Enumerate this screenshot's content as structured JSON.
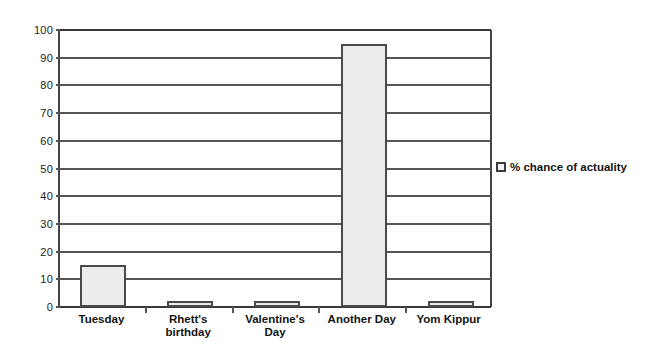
{
  "chart_data": {
    "type": "bar",
    "title": "",
    "subtitle": "",
    "xlabel": "",
    "ylabel": "",
    "categories": [
      "Tuesday",
      "Rhett's birthday",
      "Valentine's Day",
      "Another Day",
      "Yom Kippur"
    ],
    "category_lines": [
      [
        "Tuesday"
      ],
      [
        "Rhett's",
        "birthday"
      ],
      [
        "Valentine's",
        "Day"
      ],
      [
        "Another Day"
      ],
      [
        "Yom Kippur"
      ]
    ],
    "series": [
      {
        "name": "% chance of actuality",
        "values": [
          15,
          2,
          2,
          95,
          2
        ]
      }
    ],
    "ylim": [
      0,
      100
    ],
    "ytick_step": 10,
    "yticks": [
      100,
      90,
      80,
      70,
      60,
      50,
      40,
      30,
      20,
      10,
      0
    ],
    "grid": true,
    "grid_axis": "y",
    "legend": {
      "position": "right",
      "entries": [
        {
          "label": "% chance of actuality",
          "swatch_fill": "#f2f2f2",
          "swatch_border": "#3d3d3d"
        }
      ]
    },
    "colors": {
      "bar_fill": "#ececec",
      "bar_border": "#4a4a4a",
      "gridline": "#555555",
      "axis": "#3a3a3a",
      "text": "#141414",
      "background": "#ffffff"
    }
  }
}
